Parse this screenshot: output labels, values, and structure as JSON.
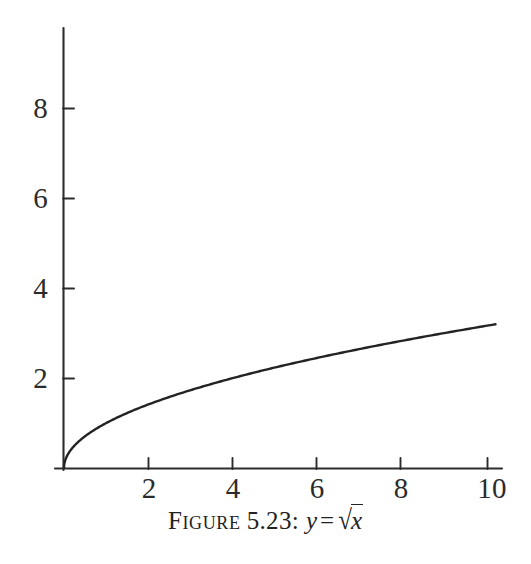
{
  "figure": {
    "caption_prefix": "Figure",
    "caption_number": "5.23",
    "caption_separator": ":",
    "caption_equation_lhs": "y",
    "caption_equation_relation": "=",
    "caption_equation_radical_sign": "√",
    "caption_equation_radicand": "x",
    "caption_plain": "FIGURE 5.23: y = √x",
    "ink_color": "#262626",
    "background_color": "#ffffff"
  },
  "chart_data": {
    "type": "line",
    "title": "",
    "subtitle": "",
    "xlabel": "",
    "ylabel": "",
    "function": "y = sqrt(x)",
    "grid": false,
    "legend": false,
    "legend_position": "none",
    "xlim": [
      0,
      10.4
    ],
    "ylim": [
      0,
      9.8
    ],
    "x_ticks": [
      2,
      4,
      6,
      8,
      10
    ],
    "x_tick_labels": [
      "2",
      "4",
      "6",
      "8",
      "10"
    ],
    "y_ticks": [
      2,
      4,
      6,
      8
    ],
    "y_tick_labels": [
      "2",
      "4",
      "6",
      "8"
    ],
    "series": [
      {
        "name": "y = sqrt(x)",
        "color": "#232323",
        "x": [
          0,
          0.05,
          0.1,
          0.2,
          0.3,
          0.4,
          0.5,
          0.75,
          1,
          1.5,
          2,
          2.5,
          3,
          3.5,
          4,
          4.5,
          5,
          5.5,
          6,
          6.5,
          7,
          7.5,
          8,
          8.5,
          9,
          9.5,
          10
        ],
        "y": [
          0,
          0.224,
          0.316,
          0.447,
          0.548,
          0.632,
          0.707,
          0.866,
          1,
          1.225,
          1.414,
          1.581,
          1.732,
          1.871,
          2,
          2.121,
          2.236,
          2.345,
          2.449,
          2.55,
          2.646,
          2.739,
          2.828,
          2.915,
          3,
          3.082,
          3.162
        ]
      }
    ]
  },
  "axes": {
    "x_axis_label": "x-axis",
    "y_axis_label": "y-axis"
  }
}
